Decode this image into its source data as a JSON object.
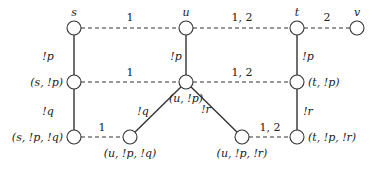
{
  "diagram": {
    "type": "graph",
    "node_radius": 7,
    "colors": {
      "stroke": "#333333",
      "text": "#222222",
      "background": "#ffffff"
    },
    "nodes": [
      {
        "id": "s",
        "label": "s",
        "x": 74,
        "y": 28,
        "lx": 74,
        "ly": 16,
        "anchor": "middle"
      },
      {
        "id": "u",
        "label": "u",
        "x": 186,
        "y": 28,
        "lx": 186,
        "ly": 16,
        "anchor": "middle"
      },
      {
        "id": "t",
        "label": "t",
        "x": 297,
        "y": 28,
        "lx": 297,
        "ly": 16,
        "anchor": "middle"
      },
      {
        "id": "v",
        "label": "v",
        "x": 357,
        "y": 28,
        "lx": 357,
        "ly": 16,
        "anchor": "middle"
      },
      {
        "id": "s_p",
        "label": "(s, !p)",
        "x": 74,
        "y": 82,
        "lx": 63,
        "ly": 86,
        "anchor": "end"
      },
      {
        "id": "u_p",
        "label": "(u, !p)",
        "x": 186,
        "y": 82,
        "lx": 186,
        "ly": 102,
        "anchor": "middle"
      },
      {
        "id": "t_p",
        "label": "(t, !p)",
        "x": 297,
        "y": 82,
        "lx": 308,
        "ly": 86,
        "anchor": "start"
      },
      {
        "id": "s_p_q",
        "label": "(s, !p, !q)",
        "x": 74,
        "y": 137,
        "lx": 63,
        "ly": 141,
        "anchor": "end"
      },
      {
        "id": "u_p_q",
        "label": "(u, !p, !q)",
        "x": 130,
        "y": 137,
        "lx": 130,
        "ly": 157,
        "anchor": "middle"
      },
      {
        "id": "u_p_r",
        "label": "(u, !p, !r)",
        "x": 242,
        "y": 137,
        "lx": 242,
        "ly": 157,
        "anchor": "middle"
      },
      {
        "id": "t_p_r",
        "label": "(t, !p, !r)",
        "x": 297,
        "y": 137,
        "lx": 308,
        "ly": 141,
        "anchor": "start"
      }
    ],
    "edges": [
      {
        "from": "s",
        "to": "u",
        "style": "dashed",
        "label": "1",
        "lx": 130,
        "ly": 21
      },
      {
        "from": "u",
        "to": "t",
        "style": "dashed",
        "label": "1, 2",
        "lx": 242,
        "ly": 21
      },
      {
        "from": "t",
        "to": "v",
        "style": "dashed",
        "label": "2",
        "lx": 327,
        "ly": 21
      },
      {
        "from": "s",
        "to": "s_p",
        "style": "solid",
        "label": "!p",
        "lx": 48,
        "ly": 60
      },
      {
        "from": "u",
        "to": "u_p",
        "style": "solid",
        "label": "!p",
        "lx": 176,
        "ly": 60
      },
      {
        "from": "t",
        "to": "t_p",
        "style": "solid",
        "label": "!p",
        "lx": 308,
        "ly": 60
      },
      {
        "from": "s_p",
        "to": "u_p",
        "style": "dashed",
        "label": "1",
        "lx": 130,
        "ly": 76
      },
      {
        "from": "u_p",
        "to": "t_p",
        "style": "dashed",
        "label": "1, 2",
        "lx": 242,
        "ly": 76
      },
      {
        "from": "s_p",
        "to": "s_p_q",
        "style": "solid",
        "label": "!q",
        "lx": 48,
        "ly": 115
      },
      {
        "from": "u_p",
        "to": "u_p_q",
        "style": "solid",
        "label": "!q",
        "lx": 143,
        "ly": 115
      },
      {
        "from": "u_p",
        "to": "u_p_r",
        "style": "solid",
        "label": "!r",
        "lx": 206,
        "ly": 113
      },
      {
        "from": "t_p",
        "to": "t_p_r",
        "style": "solid",
        "label": "!r",
        "lx": 308,
        "ly": 115
      },
      {
        "from": "s_p_q",
        "to": "u_p_q",
        "style": "dashed",
        "label": "1",
        "lx": 102,
        "ly": 131
      },
      {
        "from": "u_p_r",
        "to": "t_p_r",
        "style": "dashed",
        "label": "1, 2",
        "lx": 270,
        "ly": 131
      }
    ]
  }
}
